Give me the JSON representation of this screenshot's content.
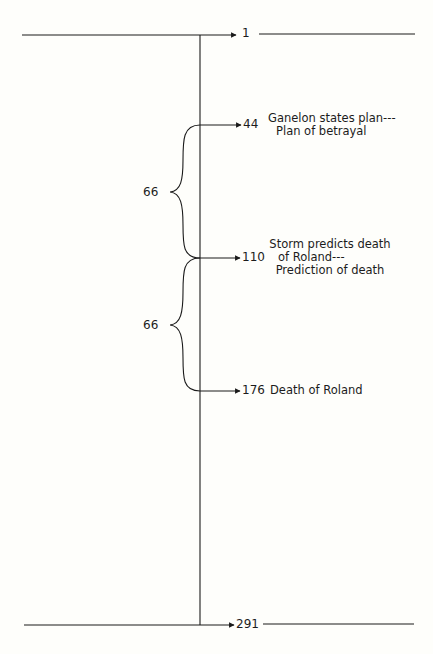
{
  "diagram": {
    "type": "timeline",
    "start": {
      "value": "1"
    },
    "end": {
      "value": "291"
    },
    "markers": [
      {
        "value": "44",
        "lines": [
          "Ganelon states plan---",
          "Plan of betrayal"
        ]
      },
      {
        "value": "110",
        "lines": [
          "Storm predicts death",
          "of Roland---",
          "Prediction of death"
        ]
      },
      {
        "value": "176",
        "lines": [
          "Death of Roland"
        ]
      }
    ],
    "intervals": [
      {
        "label": "66",
        "from": "44",
        "to": "110"
      },
      {
        "label": "66",
        "from": "110",
        "to": "176"
      }
    ],
    "colors": {
      "ink": "#1a1a1a",
      "background": "#fefefb"
    }
  }
}
